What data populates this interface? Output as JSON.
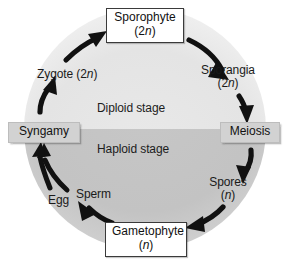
{
  "diagram": {
    "background_color": "#ffffff",
    "circle": {
      "diploid_half_color": "#e3e3e3",
      "haploid_half_color": "#c3c3c3",
      "center_x": 145,
      "center_y": 129,
      "radius": 120
    },
    "stages": [
      {
        "id": "diploid",
        "label": "Diploid stage"
      },
      {
        "id": "haploid",
        "label": "Haploid stage"
      }
    ],
    "nodes": [
      {
        "id": "sporophyte",
        "kind": "boxed",
        "name": "Sporophyte",
        "ploidy": "(2n)",
        "ploidy_prefix": "(2",
        "ploidy_italic": "n",
        "ploidy_suffix": ")"
      },
      {
        "id": "sporangia",
        "kind": "plain",
        "name": "Sporangia",
        "ploidy": "(2n)",
        "ploidy_prefix": "(2",
        "ploidy_italic": "n",
        "ploidy_suffix": ")"
      },
      {
        "id": "meiosis",
        "kind": "process",
        "name": "Meiosis",
        "ploidy": ""
      },
      {
        "id": "spores",
        "kind": "plain",
        "name": "Spores",
        "ploidy": "(n)",
        "ploidy_prefix": "(",
        "ploidy_italic": "n",
        "ploidy_suffix": ")"
      },
      {
        "id": "gametophyte",
        "kind": "boxed",
        "name": "Gametophyte",
        "ploidy": "(n)",
        "ploidy_prefix": "(",
        "ploidy_italic": "n",
        "ploidy_suffix": ")"
      },
      {
        "id": "sperm",
        "kind": "plain",
        "name": "Sperm",
        "ploidy": ""
      },
      {
        "id": "egg",
        "kind": "plain",
        "name": "Egg",
        "ploidy": ""
      },
      {
        "id": "syngamy",
        "kind": "process",
        "name": "Syngamy",
        "ploidy": ""
      },
      {
        "id": "zygote",
        "kind": "plain",
        "name": "Zygote",
        "ploidy": "(2n)",
        "ploidy_prefix": "(2",
        "ploidy_italic": "n",
        "ploidy_suffix": ")"
      }
    ],
    "arrows": [
      {
        "id": "sporophyte-to-sporangia",
        "from": "sporophyte",
        "to": "sporangia"
      },
      {
        "id": "sporangia-to-meiosis",
        "from": "sporangia",
        "to": "meiosis"
      },
      {
        "id": "meiosis-to-spores",
        "from": "meiosis",
        "to": "spores"
      },
      {
        "id": "spores-to-gametophyte",
        "from": "spores",
        "to": "gametophyte"
      },
      {
        "id": "gametophyte-to-sperm",
        "from": "gametophyte",
        "to": "sperm"
      },
      {
        "id": "sperm-to-syngamy",
        "from": "sperm",
        "to": "syngamy"
      },
      {
        "id": "egg-to-syngamy",
        "from": "egg",
        "to": "syngamy"
      },
      {
        "id": "syngamy-to-zygote",
        "from": "syngamy",
        "to": "zygote"
      },
      {
        "id": "zygote-to-sporophyte",
        "from": "zygote",
        "to": "sporophyte"
      }
    ],
    "arrow_color": "#111111"
  }
}
